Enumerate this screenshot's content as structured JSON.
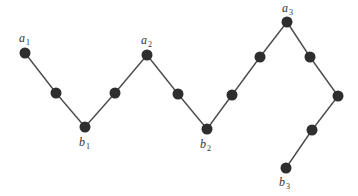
{
  "diagram": {
    "colors": {
      "node": "#2e2e2e",
      "edge": "#4a4a4a",
      "label": "#333333",
      "background": "#ffffff"
    },
    "node_radius": 5.5,
    "nodes": [
      {
        "id": "a1",
        "x": 25,
        "y": 53
      },
      {
        "id": "n1",
        "x": 56,
        "y": 93
      },
      {
        "id": "b1",
        "x": 85,
        "y": 127
      },
      {
        "id": "n2",
        "x": 115,
        "y": 93
      },
      {
        "id": "a2",
        "x": 147,
        "y": 55
      },
      {
        "id": "n3",
        "x": 178,
        "y": 94
      },
      {
        "id": "b2",
        "x": 207,
        "y": 129
      },
      {
        "id": "n4",
        "x": 232,
        "y": 95
      },
      {
        "id": "n5",
        "x": 260,
        "y": 57
      },
      {
        "id": "a3",
        "x": 287,
        "y": 22
      },
      {
        "id": "n6",
        "x": 310,
        "y": 57
      },
      {
        "id": "n7",
        "x": 338,
        "y": 96
      },
      {
        "id": "n8",
        "x": 312,
        "y": 130
      },
      {
        "id": "b3",
        "x": 286,
        "y": 168
      }
    ],
    "edges": [
      [
        "a1",
        "n1"
      ],
      [
        "n1",
        "b1"
      ],
      [
        "b1",
        "n2"
      ],
      [
        "n2",
        "a2"
      ],
      [
        "a2",
        "n3"
      ],
      [
        "n3",
        "b2"
      ],
      [
        "b2",
        "n4"
      ],
      [
        "n4",
        "n5"
      ],
      [
        "n5",
        "a3"
      ],
      [
        "a3",
        "n6"
      ],
      [
        "n6",
        "n7"
      ],
      [
        "n7",
        "n8"
      ],
      [
        "n8",
        "b3"
      ]
    ],
    "labels": [
      {
        "id": "label-a1",
        "base": "a",
        "sub": "1",
        "x": 19,
        "y": 42
      },
      {
        "id": "label-b1",
        "base": "b",
        "sub": "1",
        "x": 79,
        "y": 146
      },
      {
        "id": "label-a2",
        "base": "a",
        "sub": "2",
        "x": 141,
        "y": 44
      },
      {
        "id": "label-b2",
        "base": "b",
        "sub": "2",
        "x": 200,
        "y": 148
      },
      {
        "id": "label-a3",
        "base": "a",
        "sub": "3",
        "x": 282,
        "y": 12
      },
      {
        "id": "label-b3",
        "base": "b",
        "sub": "3",
        "x": 279,
        "y": 186
      }
    ]
  }
}
